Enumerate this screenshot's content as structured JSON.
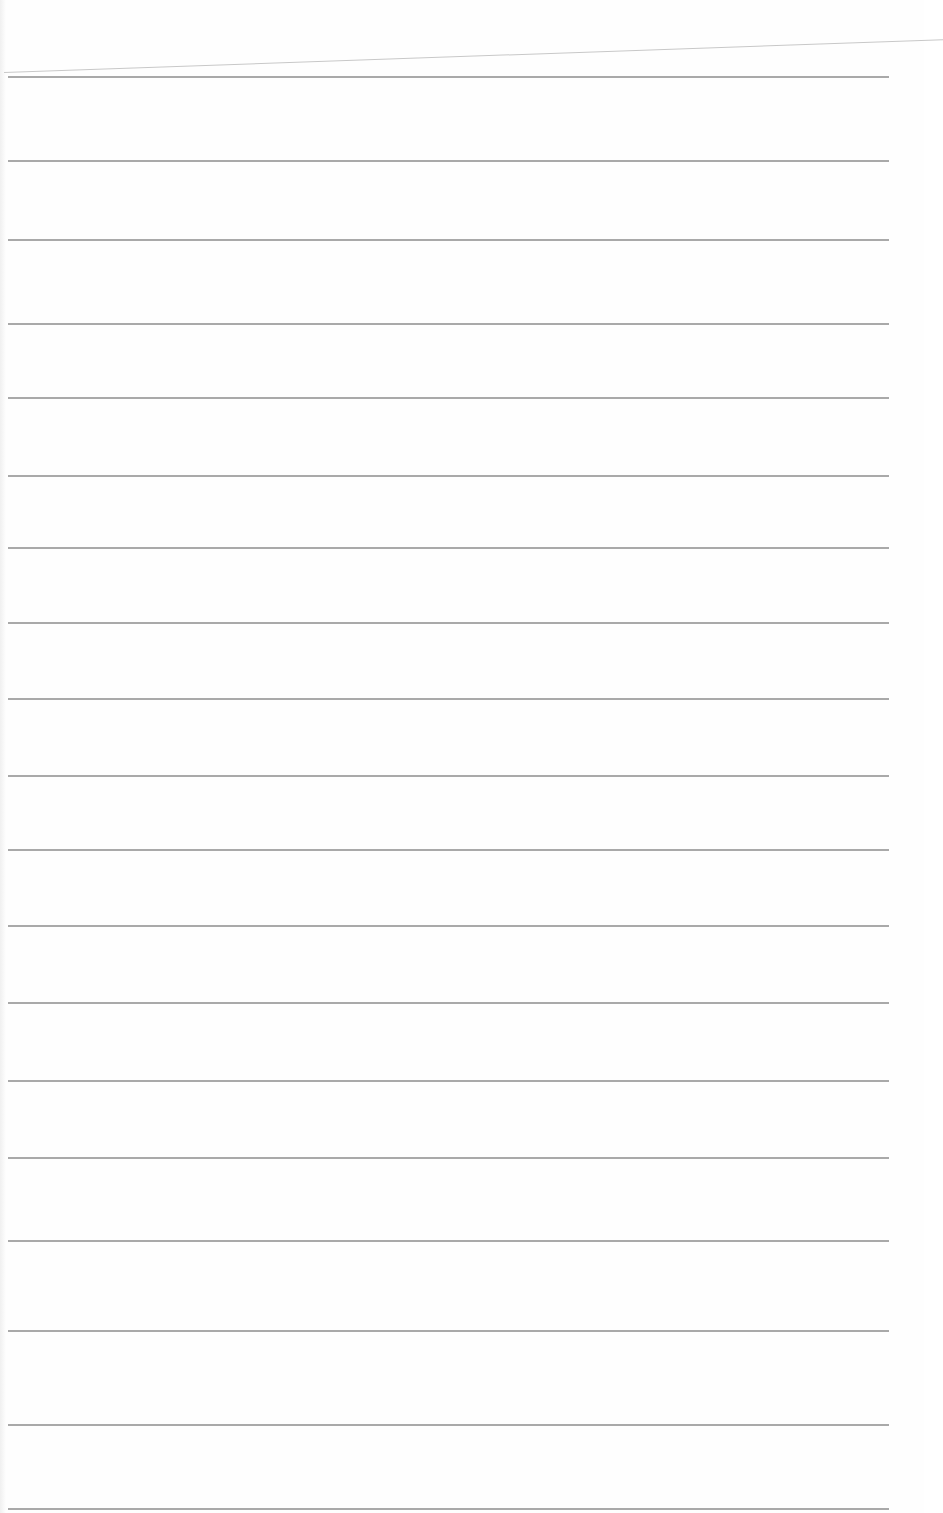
{
  "page": {
    "type": "blank lined paper",
    "line_color": "#9a9a9a",
    "background": "#fefefe",
    "rules": [
      {
        "y": 76,
        "x1": 8,
        "x2": 889
      },
      {
        "y": 160,
        "x1": 8,
        "x2": 889
      },
      {
        "y": 239,
        "x1": 8,
        "x2": 889
      },
      {
        "y": 323,
        "x1": 8,
        "x2": 889
      },
      {
        "y": 397,
        "x1": 8,
        "x2": 889
      },
      {
        "y": 475,
        "x1": 8,
        "x2": 889
      },
      {
        "y": 547,
        "x1": 8,
        "x2": 889
      },
      {
        "y": 622,
        "x1": 8,
        "x2": 889
      },
      {
        "y": 698,
        "x1": 8,
        "x2": 889
      },
      {
        "y": 775,
        "x1": 8,
        "x2": 889
      },
      {
        "y": 849,
        "x1": 8,
        "x2": 889
      },
      {
        "y": 925,
        "x1": 8,
        "x2": 889
      },
      {
        "y": 1002,
        "x1": 8,
        "x2": 889
      },
      {
        "y": 1080,
        "x1": 8,
        "x2": 889
      },
      {
        "y": 1157,
        "x1": 8,
        "x2": 889
      },
      {
        "y": 1240,
        "x1": 8,
        "x2": 889
      },
      {
        "y": 1330,
        "x1": 8,
        "x2": 889
      },
      {
        "y": 1424,
        "x1": 8,
        "x2": 889
      },
      {
        "y": 1508,
        "x1": 8,
        "x2": 889
      }
    ]
  }
}
